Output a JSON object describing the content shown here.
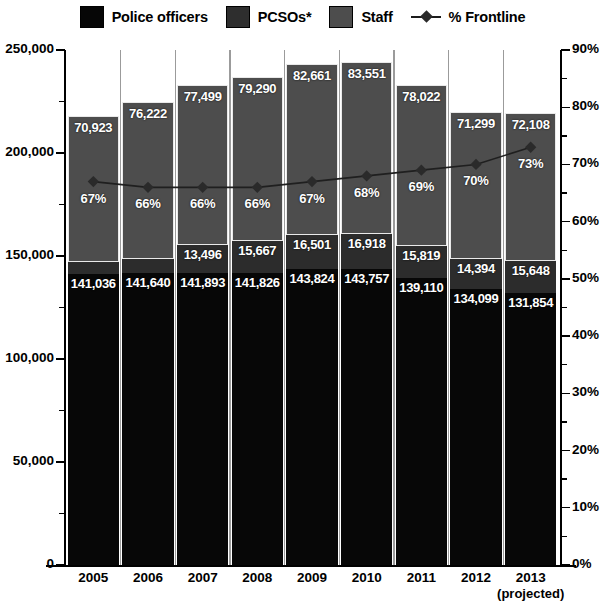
{
  "legend": {
    "items": [
      {
        "label": "Police officers",
        "swatch": "police-swatch",
        "color": "#060606",
        "type": "bar"
      },
      {
        "label": "PCSOs*",
        "swatch": "pcso-swatch",
        "color": "#2e2e2e",
        "type": "bar"
      },
      {
        "label": "Staff",
        "swatch": "staff-swatch",
        "color": "#4d4d4d",
        "type": "bar"
      },
      {
        "label": "% Frontline",
        "swatch": "frontline-line-marker",
        "color": "#1c1c1c",
        "type": "line"
      }
    ]
  },
  "axes": {
    "left_ticks": [
      "0",
      "50,000",
      "100,000",
      "150,000",
      "200,000",
      "250,000"
    ],
    "right_ticks": [
      "0%",
      "10%",
      "20%",
      "30%",
      "40%",
      "50%",
      "60%",
      "70%",
      "80%",
      "90%"
    ]
  },
  "x_labels": [
    {
      "year": "2005",
      "note": ""
    },
    {
      "year": "2006",
      "note": ""
    },
    {
      "year": "2007",
      "note": ""
    },
    {
      "year": "2008",
      "note": ""
    },
    {
      "year": "2009",
      "note": ""
    },
    {
      "year": "2010",
      "note": ""
    },
    {
      "year": "2011",
      "note": ""
    },
    {
      "year": "2012",
      "note": ""
    },
    {
      "year": "2013",
      "note": "(projected)"
    }
  ],
  "chart_data": {
    "type": "bar",
    "stacked": true,
    "title": "",
    "xlabel": "",
    "ylabel": "",
    "categories": [
      "2005",
      "2006",
      "2007",
      "2008",
      "2009",
      "2010",
      "2011",
      "2012",
      "2013 (projected)"
    ],
    "series": [
      {
        "name": "Police officers",
        "color": "#070707",
        "axis": "left",
        "values": [
          141036,
          141640,
          141893,
          141826,
          143824,
          143757,
          139110,
          134099,
          131854
        ],
        "labels": [
          "141,036",
          "141,640",
          "141,893",
          "141,826",
          "143,824",
          "143,757",
          "139,110",
          "134,099",
          "131,854"
        ]
      },
      {
        "name": "PCSOs*",
        "color": "#2c2c2c",
        "axis": "left",
        "values": [
          5910,
          6769,
          13496,
          15667,
          16501,
          16918,
          15819,
          14394,
          15648
        ],
        "labels": [
          "5,910",
          "6,769",
          "13,496",
          "15,667",
          "16,501",
          "16,918",
          "15,819",
          "14,394",
          "15,648"
        ]
      },
      {
        "name": "Staff",
        "color": "#4d4d4d",
        "axis": "left",
        "values": [
          70923,
          76222,
          77499,
          79290,
          82661,
          83551,
          78022,
          71299,
          72108
        ],
        "labels": [
          "70,923",
          "76,222",
          "77,499",
          "79,290",
          "82,661",
          "83,551",
          "78,022",
          "71,299",
          "72,108"
        ]
      },
      {
        "name": "% Frontline",
        "color": "#1c1c1c",
        "axis": "right",
        "type": "line",
        "values": [
          67,
          66,
          66,
          66,
          67,
          68,
          69,
          70,
          73
        ],
        "labels": [
          "67%",
          "66%",
          "66%",
          "66%",
          "67%",
          "68%",
          "69%",
          "70%",
          "73%"
        ]
      }
    ],
    "ylim": [
      0,
      250000
    ],
    "ytick_step": 50000,
    "y2lim": [
      0,
      90
    ],
    "y2tick_step": 10,
    "grid": false,
    "legend_position": "top"
  }
}
